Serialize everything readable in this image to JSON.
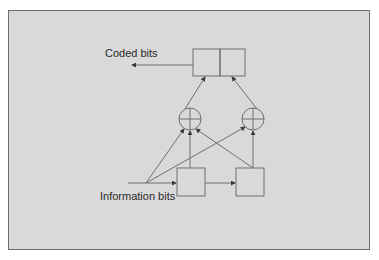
{
  "diagram": {
    "title": "",
    "type": "convolutional-encoder",
    "labels": {
      "coded_bits": "Coded bits",
      "information_bits": "Information bits"
    },
    "colors": {
      "background": "#d9d9d9",
      "stroke": "#6e6e6e",
      "text": "#2a2a2a",
      "page": "#ffffff"
    },
    "nodes": [
      {
        "id": "input-point",
        "kind": "junction",
        "label": "Information bits"
      },
      {
        "id": "shift-register-1",
        "kind": "register-cell"
      },
      {
        "id": "shift-register-2",
        "kind": "register-cell"
      },
      {
        "id": "xor-left",
        "kind": "modulo-2-adder",
        "symbol": "⊕"
      },
      {
        "id": "xor-right",
        "kind": "modulo-2-adder",
        "symbol": "⊕"
      },
      {
        "id": "output-commutator-left",
        "kind": "output-cell"
      },
      {
        "id": "output-commutator-right",
        "kind": "output-cell"
      },
      {
        "id": "output-point",
        "kind": "terminal",
        "label": "Coded bits"
      }
    ],
    "edges": [
      {
        "from": "input-point",
        "to": "shift-register-1"
      },
      {
        "from": "input-point",
        "to": "xor-left"
      },
      {
        "from": "input-point",
        "to": "xor-right"
      },
      {
        "from": "shift-register-1",
        "to": "shift-register-2"
      },
      {
        "from": "shift-register-1",
        "to": "xor-left"
      },
      {
        "from": "shift-register-2",
        "to": "xor-left"
      },
      {
        "from": "shift-register-2",
        "to": "xor-right"
      },
      {
        "from": "xor-left",
        "to": "output-commutator-left"
      },
      {
        "from": "xor-right",
        "to": "output-commutator-right"
      },
      {
        "from": "output-commutator-left",
        "to": "output-point"
      }
    ]
  }
}
